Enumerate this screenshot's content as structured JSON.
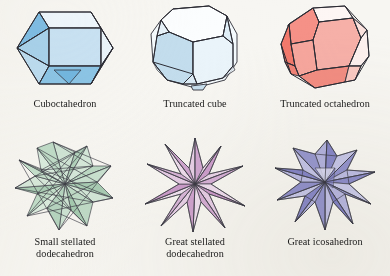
{
  "plate": {
    "background_color": "#f7f6f2",
    "layout": "2 rows x 3 columns grid of polyhedron illustrations with captions",
    "caption_color": "#1b1b1b"
  },
  "figures": [
    {
      "id": "cuboctahedron",
      "caption": "Cuboctahedron",
      "family": "Archimedean solid",
      "fill_color": "#b8d8ee",
      "fill_color_dark": "#7fbde4",
      "fill_color_light": "#e4f1fa",
      "edge_color": "#2b2b33",
      "row": 1,
      "column": 1
    },
    {
      "id": "truncated-cube",
      "caption": "Truncated cube",
      "family": "Archimedean solid",
      "fill_color": "#bfdcef",
      "fill_color_dark": "#a8cfe8",
      "fill_color_light": "#f2f8fc",
      "edge_color": "#2b2b33",
      "row": 1,
      "column": 2
    },
    {
      "id": "truncated-octahedron",
      "caption": "Truncated octahedron",
      "family": "Archimedean solid",
      "fill_color": "#f4a8a0",
      "fill_color_dark": "#f08478",
      "fill_color_light": "#fbeeeb",
      "edge_color": "#2b2b33",
      "row": 1,
      "column": 3
    },
    {
      "id": "small-stellated-dodecahedron",
      "caption": "Small stellated\ndodecahedron",
      "family": "Kepler-Poinsot polyhedron",
      "fill_color": "#bcd9c4",
      "fill_color_dark": "#9cc4a8",
      "fill_color_light": "#e3f0e7",
      "edge_color": "#2f5e44",
      "row": 2,
      "column": 1
    },
    {
      "id": "great-stellated-dodecahedron",
      "caption": "Great stellated\ndodecahedron",
      "family": "Kepler-Poinsot polyhedron",
      "fill_color": "#dcb4dc",
      "fill_color_dark": "#c894c8",
      "fill_color_light": "#f3e6f3",
      "edge_color": "#5a3a5a",
      "row": 2,
      "column": 2
    },
    {
      "id": "great-icosahedron",
      "caption": "Great icosahedron",
      "family": "Kepler-Poinsot polyhedron",
      "fill_color": "#9a9ad0",
      "fill_color_dark": "#7d7dc0",
      "fill_color_light": "#dcdcf0",
      "edge_color": "#2b2b44",
      "row": 2,
      "column": 3
    }
  ]
}
